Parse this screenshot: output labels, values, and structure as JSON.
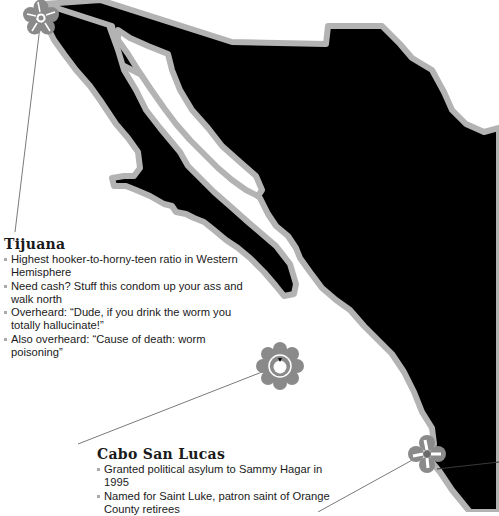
{
  "map": {
    "subject": "Mexico map silhouette",
    "colors": {
      "land": "#000000",
      "coast_outline": "#b3b3b3",
      "marker": "#8a8a8a",
      "leader_line": "#7a7a7a",
      "background": "#ffffff",
      "text": "#1a1a1a"
    }
  },
  "markers": [
    {
      "id": "tijuana",
      "icon": "flower-icon",
      "label": "Tijuana"
    },
    {
      "id": "cabo-san-lucas",
      "icon": "scalloped-flower-icon",
      "label": "Cabo San Lucas"
    },
    {
      "id": "unlabeled-south",
      "icon": "flower-icon",
      "label": ""
    }
  ],
  "callouts": {
    "tijuana": {
      "title": "Tijuana",
      "bullets": [
        "Highest hooker-to-horny-teen ratio in Western Hemisphere",
        "Need cash? Stuff this condom up your ass and walk north",
        "Overheard: “Dude, if you drink the worm you totally hallucinate!”",
        "Also overheard: “Cause of death: worm poisoning”"
      ]
    },
    "cabo": {
      "title": "Cabo San Lucas",
      "bullets": [
        "Granted political asylum to Sammy Hagar in 1995",
        "Named for Saint Luke, patron saint of Orange County retirees"
      ]
    }
  }
}
